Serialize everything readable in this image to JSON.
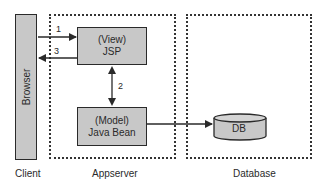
{
  "diagram": {
    "client": {
      "browser_label": "Browser",
      "zone_label": "Client"
    },
    "appserver": {
      "zone_label": "Appserver",
      "view_box": {
        "line1": "(View)",
        "line2": "JSP"
      },
      "model_box": {
        "line1": "(Model)",
        "line2": "Java Bean"
      }
    },
    "database": {
      "zone_label": "Database",
      "db_label": "DB"
    },
    "arrows": [
      {
        "label": "1",
        "from": "Browser",
        "to": "JSP"
      },
      {
        "label": "2",
        "from": "JSP",
        "to": "Java Bean",
        "bidirectional": true
      },
      {
        "label": "3",
        "from": "JSP",
        "to": "Browser"
      },
      {
        "label": "",
        "from": "Java Bean",
        "to": "DB"
      }
    ],
    "colors": {
      "box_fill": "#c8c8c8",
      "stroke": "#2a2a2a"
    }
  }
}
